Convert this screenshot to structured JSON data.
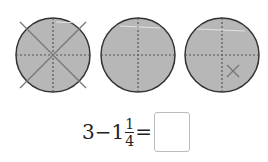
{
  "figure": {
    "circles": [
      {
        "id": "circle-1",
        "parts": 4,
        "crossed": "whole"
      },
      {
        "id": "circle-2",
        "parts": 4,
        "crossed": "none"
      },
      {
        "id": "circle-3",
        "parts": 4,
        "crossed": "one-quarter"
      }
    ],
    "fill_color": "#b7b7b7",
    "stroke_color": "#333333"
  },
  "equation": {
    "minuend": "3",
    "minus": "−",
    "whole": "1",
    "numerator": "1",
    "denominator": "4",
    "equals": "=",
    "answer": ""
  }
}
